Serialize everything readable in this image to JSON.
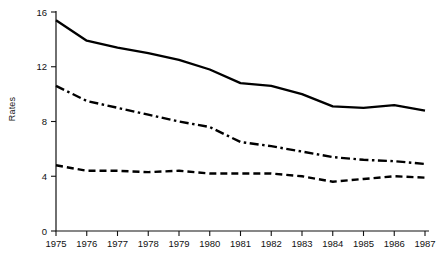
{
  "chart_data": {
    "type": "line",
    "title": "",
    "subtitle": "",
    "xlabel": "",
    "ylabel": "Rates",
    "x": [
      1975,
      1976,
      1977,
      1978,
      1979,
      1980,
      1981,
      1982,
      1983,
      1984,
      1985,
      1986,
      1987
    ],
    "categories": [
      "1975",
      "1976",
      "1977",
      "1978",
      "1979",
      "1980",
      "1981",
      "1982",
      "1983",
      "1984",
      "1985",
      "1986",
      "1987"
    ],
    "xlim": [
      1975,
      1987
    ],
    "ylim": [
      0,
      16
    ],
    "y_ticks": [
      0,
      4,
      8,
      12,
      16
    ],
    "y_tick_labels": [
      "0",
      "4",
      "8",
      "12",
      "16"
    ],
    "x_tick_labels": [
      "1975",
      "1976",
      "1977",
      "1978",
      "1979",
      "1980",
      "1981",
      "1982",
      "1983",
      "1984",
      "1985",
      "1986",
      "1987"
    ],
    "grid": false,
    "legend_position": "none",
    "series": [
      {
        "name": "solid-series",
        "style": "solid",
        "color": "#000000",
        "values": [
          15.4,
          13.9,
          13.4,
          13.0,
          12.5,
          11.8,
          10.8,
          10.6,
          10.0,
          9.1,
          9.0,
          9.2,
          8.8
        ]
      },
      {
        "name": "dash-dot-series",
        "style": "dash-dot",
        "color": "#000000",
        "values": [
          10.6,
          9.5,
          9.0,
          8.5,
          8.0,
          7.6,
          6.5,
          6.2,
          5.8,
          5.4,
          5.2,
          5.1,
          4.9
        ]
      },
      {
        "name": "dashed-series",
        "style": "dashed",
        "color": "#000000",
        "values": [
          4.8,
          4.4,
          4.4,
          4.3,
          4.4,
          4.2,
          4.2,
          4.2,
          4.0,
          3.6,
          3.8,
          4.0,
          3.9
        ]
      }
    ]
  }
}
